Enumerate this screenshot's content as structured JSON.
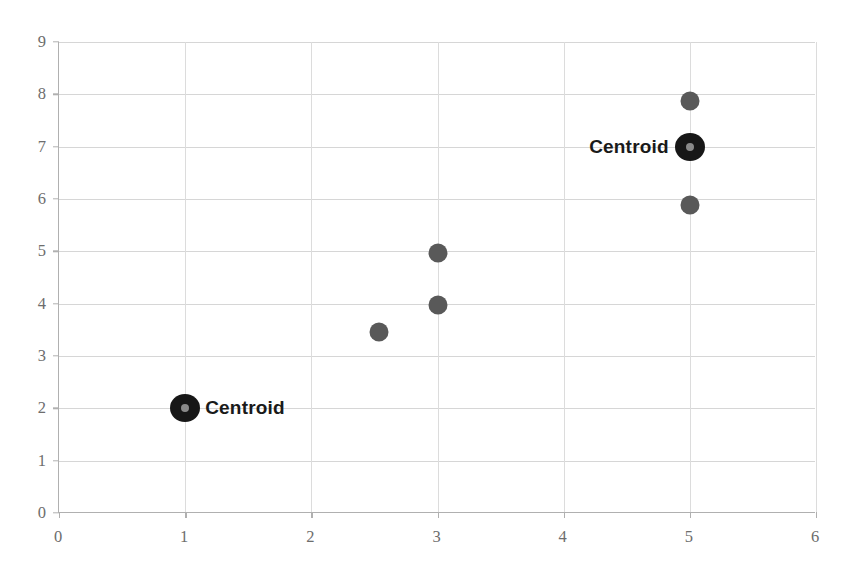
{
  "chart_data": {
    "type": "scatter",
    "title": "",
    "subtitle": "",
    "xlabel": "",
    "ylabel": "",
    "xlim": [
      0,
      6
    ],
    "ylim": [
      0,
      9
    ],
    "xticks": [
      0,
      1,
      2,
      3,
      4,
      5,
      6
    ],
    "yticks": [
      0,
      1,
      2,
      3,
      4,
      5,
      6,
      7,
      8,
      9
    ],
    "xtick_labels": [
      "0",
      "1",
      "2",
      "3",
      "4",
      "5",
      "6"
    ],
    "ytick_labels": [
      "0",
      "1",
      "2",
      "3",
      "4",
      "5",
      "6",
      "7",
      "8",
      "9"
    ],
    "grid": true,
    "grid_axes": "both",
    "legend": false,
    "legend_position": "none",
    "series": [
      {
        "name": "data-points",
        "marker": "circle",
        "color": "#595959",
        "marker_size": 19,
        "points": [
          {
            "x": 2.54,
            "y": 3.46,
            "label": ""
          },
          {
            "x": 3.0,
            "y": 3.98,
            "label": ""
          },
          {
            "x": 3.0,
            "y": 4.96,
            "label": ""
          },
          {
            "x": 5.0,
            "y": 5.89,
            "label": ""
          },
          {
            "x": 5.0,
            "y": 7.88,
            "label": ""
          }
        ]
      },
      {
        "name": "centroids",
        "marker": "circle-dot",
        "color": "#171717",
        "inner_color": "#8a8a8a",
        "marker_size": 30,
        "points": [
          {
            "x": 1.0,
            "y": 2.0,
            "label": "Centroid",
            "label_side": "right"
          },
          {
            "x": 5.0,
            "y": 7.0,
            "label": "Centroid",
            "label_side": "left"
          }
        ]
      }
    ],
    "annotations": [
      {
        "text": "Centroid",
        "x": 1.0,
        "y": 2.0,
        "side": "right"
      },
      {
        "text": "Centroid",
        "x": 5.0,
        "y": 7.0,
        "side": "left"
      }
    ],
    "colors": {
      "data_marker": "#595959",
      "centroid_marker": "#171717",
      "centroid_inner": "#8a8a8a",
      "gridline": "#d6d6d6",
      "axis_line": "#b0b0b0",
      "tick_label": "#6d6d6d",
      "annotation_text": "#1a1a1a",
      "background": "#ffffff"
    }
  }
}
